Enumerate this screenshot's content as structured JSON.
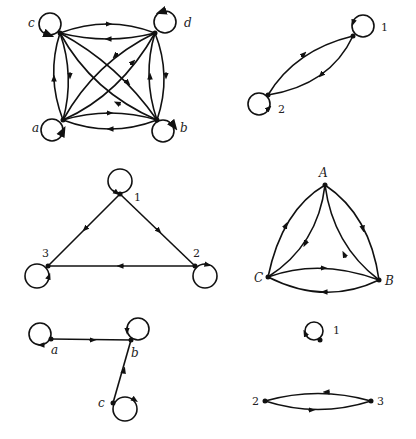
{
  "diagrams": [
    {
      "id": "complete4",
      "nodes": [
        {
          "id": "c",
          "label": "c",
          "x": 60,
          "y": 33,
          "lx": 28,
          "ly": 27,
          "loop": {
            "cx": 50,
            "cy": 24,
            "r": 11
          }
        },
        {
          "id": "d",
          "label": "d",
          "x": 155,
          "y": 33,
          "lx": 184,
          "ly": 27,
          "loop": {
            "cx": 165,
            "cy": 22,
            "r": 11
          }
        },
        {
          "id": "a",
          "label": "a",
          "x": 63,
          "y": 120,
          "lx": 32,
          "ly": 132,
          "loop": {
            "cx": 52,
            "cy": 130,
            "r": 11
          }
        },
        {
          "id": "b",
          "label": "b",
          "x": 157,
          "y": 120,
          "lx": 180,
          "ly": 132,
          "loop": {
            "cx": 163,
            "cy": 131,
            "r": 11
          }
        }
      ]
    },
    {
      "id": "two-node",
      "nodes": [
        {
          "id": "1",
          "label": "1",
          "x": 353,
          "y": 36,
          "lx": 381,
          "ly": 31,
          "loop": {
            "cx": 363,
            "cy": 26,
            "r": 11
          }
        },
        {
          "id": "2",
          "label": "2",
          "x": 268,
          "y": 95,
          "lx": 278,
          "ly": 113,
          "loop": {
            "cx": 259,
            "cy": 104,
            "r": 11
          }
        }
      ]
    },
    {
      "id": "triangle",
      "nodes": [
        {
          "id": "1",
          "label": "1",
          "x": 120,
          "y": 194,
          "lx": 134,
          "ly": 201
        },
        {
          "id": "2",
          "label": "2",
          "x": 195,
          "y": 266,
          "lx": 193,
          "ly": 257
        },
        {
          "id": "3",
          "label": "3",
          "x": 48,
          "y": 266,
          "lx": 42,
          "ly": 257
        }
      ]
    },
    {
      "id": "ABC",
      "nodes": [
        {
          "id": "A",
          "label": "A",
          "x": 325,
          "y": 185,
          "lx": 319,
          "ly": 177
        },
        {
          "id": "B",
          "label": "B",
          "x": 379,
          "y": 280,
          "lx": 385,
          "ly": 285
        },
        {
          "id": "C",
          "label": "C",
          "x": 268,
          "y": 277,
          "lx": 254,
          "ly": 282
        }
      ]
    },
    {
      "id": "abc-path",
      "nodes": [
        {
          "id": "a",
          "label": "a",
          "x": 51,
          "y": 339,
          "lx": 51,
          "ly": 354
        },
        {
          "id": "b",
          "label": "b",
          "x": 131,
          "y": 340,
          "lx": 131,
          "ly": 357
        },
        {
          "id": "c",
          "label": "c",
          "x": 113,
          "y": 403,
          "lx": 98,
          "ly": 407
        }
      ]
    },
    {
      "id": "disconnected",
      "nodes": [
        {
          "id": "1",
          "label": "1",
          "x": 320,
          "y": 340,
          "lx": 333,
          "ly": 334
        },
        {
          "id": "2",
          "label": "2",
          "x": 265,
          "y": 401,
          "lx": 252,
          "ly": 405
        },
        {
          "id": "3",
          "label": "3",
          "x": 371,
          "y": 401,
          "lx": 377,
          "ly": 405
        }
      ]
    }
  ],
  "labels": {
    "d1_c": "c",
    "d1_d": "d",
    "d1_a": "a",
    "d1_b": "b",
    "d2_1": "1",
    "d2_2": "2",
    "d3_1": "1",
    "d3_2": "2",
    "d3_3": "3",
    "d4_A": "A",
    "d4_B": "B",
    "d4_C": "C",
    "d5_a": "a",
    "d5_b": "b",
    "d5_c": "c",
    "d6_1": "1",
    "d6_2": "2",
    "d6_3": "3"
  },
  "colors": {
    "stroke": "#111111",
    "background": "#ffffff"
  }
}
